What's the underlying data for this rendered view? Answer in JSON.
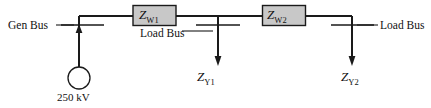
{
  "diagram": {
    "type": "single-line-power-system-schematic",
    "labels": {
      "gen_bus": "Gen Bus",
      "load_bus_1": "Load Bus",
      "load_bus_2": "Load Bus",
      "source_voltage": "250 kV",
      "series_impedance_1_symbol": "Z",
      "series_impedance_1_subscript": "W1",
      "series_impedance_2_symbol": "Z",
      "series_impedance_2_subscript": "W2",
      "shunt_impedance_1_symbol": "Z",
      "shunt_impedance_1_subscript": "Y1",
      "shunt_impedance_2_symbol": "Z",
      "shunt_impedance_2_subscript": "Y2"
    },
    "colors": {
      "line": "#1a1a1a",
      "box_fill": "#c8c8c8",
      "box_stroke": "#1a1a1a",
      "background": "#ffffff"
    }
  }
}
